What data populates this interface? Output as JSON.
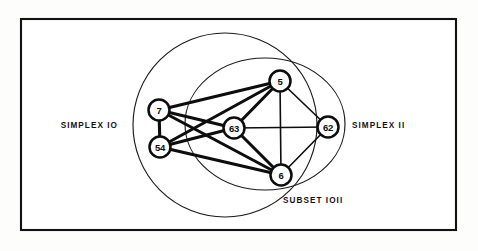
{
  "figure": {
    "background_color": "#fdfdfc",
    "frame_color": "#121212",
    "ink_color": "#0d0d0d"
  },
  "labels": {
    "simplex_left": "SIMPLEX  IO",
    "simplex_right": "SIMPLEX  II",
    "subset": "SUBSET    IOII"
  },
  "chart_data": {
    "type": "diagram",
    "regions": [
      {
        "id": "simplex-10",
        "label": "SIMPLEX  IO",
        "shape": "circle",
        "cx": 225,
        "cy": 125,
        "rx": 92,
        "ry": 92,
        "label_x": 118,
        "label_y": 128,
        "label_anchor": "end"
      },
      {
        "id": "simplex-11",
        "label": "SIMPLEX  II",
        "shape": "ellipse",
        "cx": 265,
        "cy": 124,
        "rx": 80,
        "ry": 66,
        "label_x": 352,
        "label_y": 128,
        "label_anchor": "start"
      },
      {
        "id": "subset-1011",
        "label": "SUBSET    IOII",
        "shape": "intersection",
        "label_x": 283,
        "label_y": 203,
        "label_anchor": "start"
      }
    ],
    "nodes": [
      {
        "id": "n7",
        "label": "7",
        "x": 159,
        "y": 110,
        "r": 10.5
      },
      {
        "id": "n54",
        "label": "54",
        "x": 160,
        "y": 147,
        "r": 10.5
      },
      {
        "id": "n63",
        "label": "63",
        "x": 234,
        "y": 128,
        "r": 10.5
      },
      {
        "id": "n5",
        "label": "5",
        "x": 280,
        "y": 81,
        "r": 10.5
      },
      {
        "id": "n6",
        "label": "6",
        "x": 281,
        "y": 175,
        "r": 10.5
      },
      {
        "id": "n62",
        "label": "62",
        "x": 328,
        "y": 127,
        "r": 10.5
      }
    ],
    "edges": [
      {
        "from": "n7",
        "to": "n54",
        "weight": "thick"
      },
      {
        "from": "n7",
        "to": "n63",
        "weight": "thick"
      },
      {
        "from": "n7",
        "to": "n5",
        "weight": "thick"
      },
      {
        "from": "n7",
        "to": "n6",
        "weight": "thick"
      },
      {
        "from": "n54",
        "to": "n63",
        "weight": "thick"
      },
      {
        "from": "n54",
        "to": "n5",
        "weight": "thick"
      },
      {
        "from": "n54",
        "to": "n6",
        "weight": "thick"
      },
      {
        "from": "n63",
        "to": "n5",
        "weight": "thick"
      },
      {
        "from": "n63",
        "to": "n6",
        "weight": "thick"
      },
      {
        "from": "n63",
        "to": "n62",
        "weight": "thin"
      },
      {
        "from": "n5",
        "to": "n6",
        "weight": "thin"
      },
      {
        "from": "n5",
        "to": "n62",
        "weight": "thin"
      },
      {
        "from": "n6",
        "to": "n62",
        "weight": "thin"
      }
    ],
    "frame": {
      "x": 21,
      "y": 19,
      "width": 435,
      "height": 211
    }
  }
}
